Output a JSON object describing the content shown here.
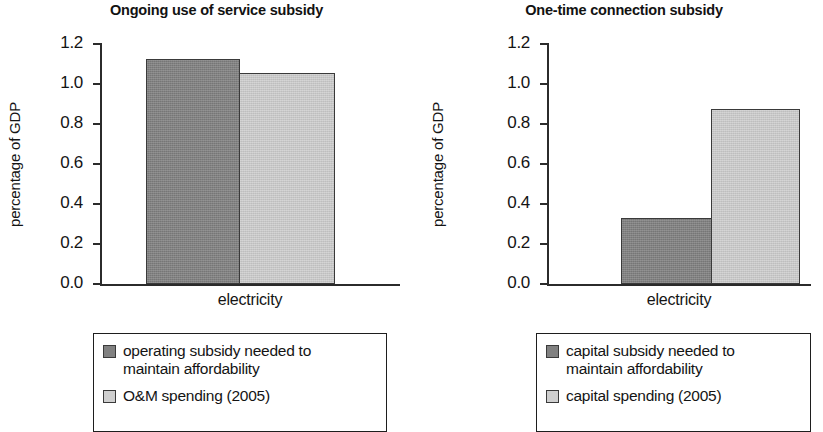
{
  "chart_data": [
    {
      "type": "bar",
      "title": "Ongoing use of service subsidy",
      "xlabel": "electricity",
      "ylabel": "percentage of GDP",
      "categories": [
        "electricity"
      ],
      "ylim": [
        0.0,
        1.2
      ],
      "yticks": [
        "0.0",
        "0.2",
        "0.4",
        "0.6",
        "0.8",
        "1.0",
        "1.2"
      ],
      "grid": false,
      "legend_position": "below-plot",
      "series": [
        {
          "name": "operating subsidy needed to maintain affordability",
          "values": [
            1.12
          ],
          "color": "#818181"
        },
        {
          "name": "O&M spending (2005)",
          "values": [
            1.05
          ],
          "color": "#cfcfcf"
        }
      ]
    },
    {
      "type": "bar",
      "title": "One-time connection subsidy",
      "xlabel": "electricity",
      "ylabel": "percentage of GDP",
      "categories": [
        "electricity"
      ],
      "ylim": [
        0.0,
        1.2
      ],
      "yticks": [
        "0.0",
        "0.2",
        "0.4",
        "0.6",
        "0.8",
        "1.0",
        "1.2"
      ],
      "grid": false,
      "legend_position": "below-plot",
      "series": [
        {
          "name": "capital subsidy needed to maintain affordability",
          "values": [
            0.33
          ],
          "color": "#818181"
        },
        {
          "name": "capital spending (2005)",
          "values": [
            0.87
          ],
          "color": "#cfcfcf"
        }
      ]
    }
  ],
  "panels": [
    {
      "title": "Ongoing use of service subsidy",
      "ylabel": "percentage of GDP",
      "xlabel": "electricity",
      "yticks": [
        "1.2",
        "1.0",
        "0.8",
        "0.6",
        "0.4",
        "0.2",
        "0.0"
      ],
      "bars": [
        {
          "label": "operating subsidy needed to maintain affordability",
          "value": 1.12,
          "style": "dark"
        },
        {
          "label": "O&M spending (2005)",
          "value": 1.05,
          "style": "light"
        }
      ],
      "legend": [
        {
          "line1": "operating subsidy needed to",
          "line2": "maintain affordability",
          "style": "dark"
        },
        {
          "line1": "O&M spending (2005)",
          "line2": "",
          "style": "light"
        }
      ]
    },
    {
      "title": "One-time connection subsidy",
      "ylabel": "percentage of GDP",
      "xlabel": "electricity",
      "yticks": [
        "1.2",
        "1.0",
        "0.8",
        "0.6",
        "0.4",
        "0.2",
        "0.0"
      ],
      "bars": [
        {
          "label": "capital subsidy needed to maintain affordability",
          "value": 0.33,
          "style": "dark"
        },
        {
          "label": "capital spending (2005)",
          "value": 0.87,
          "style": "light"
        }
      ],
      "legend": [
        {
          "line1": "capital subsidy needed to",
          "line2": "maintain affordability",
          "style": "dark"
        },
        {
          "line1": "capital spending (2005)",
          "line2": "",
          "style": "light"
        }
      ]
    }
  ]
}
